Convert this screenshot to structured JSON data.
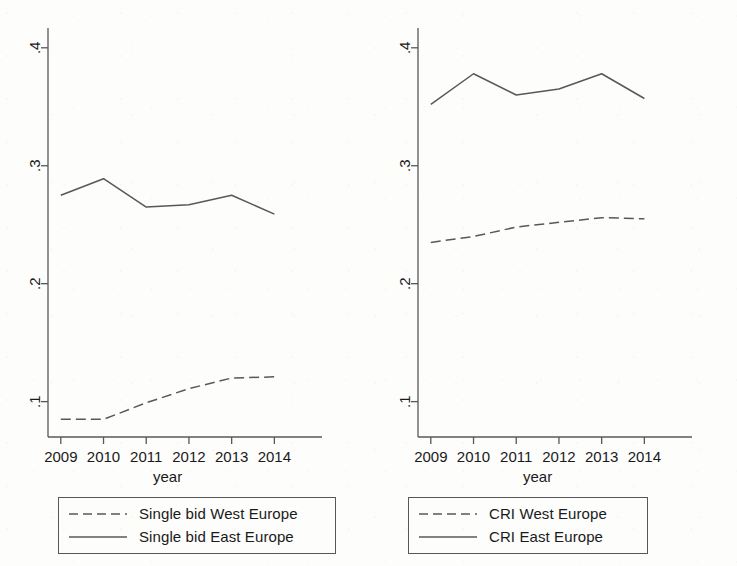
{
  "figure": {
    "background_color": "#fdfdfc",
    "line_color": "#58585a",
    "text_color": "#1a1a1a"
  },
  "panels": [
    {
      "id": "left",
      "axis": {
        "x_label": "year",
        "x_ticks": [
          "2009",
          "2010",
          "2011",
          "2012",
          "2013",
          "2014"
        ],
        "y_ticks": [
          ".1",
          ".2",
          ".3",
          ".4"
        ]
      },
      "legend": {
        "entries": [
          {
            "label": "Single bid West Europe",
            "style": "dashed"
          },
          {
            "label": "Single bid East Europe",
            "style": "solid"
          }
        ]
      }
    },
    {
      "id": "right",
      "axis": {
        "x_label": "year",
        "x_ticks": [
          "2009",
          "2010",
          "2011",
          "2012",
          "2013",
          "2014"
        ],
        "y_ticks": [
          ".1",
          ".2",
          ".3",
          ".4"
        ]
      },
      "legend": {
        "entries": [
          {
            "label": "CRI West Europe",
            "style": "dashed"
          },
          {
            "label": "CRI East Europe",
            "style": "solid"
          }
        ]
      }
    }
  ],
  "chart_data": [
    {
      "type": "line",
      "panel": "left",
      "title": "",
      "xlabel": "year",
      "ylabel": "",
      "x": [
        2009,
        2010,
        2011,
        2012,
        2013,
        2014
      ],
      "xtick_labels": [
        "2009",
        "2010",
        "2011",
        "2012",
        "2013",
        "2014"
      ],
      "ytick_labels": [
        ".1",
        ".2",
        ".3",
        ".4"
      ],
      "ytick_values": [
        0.1,
        0.2,
        0.3,
        0.4
      ],
      "ylim": [
        0.07,
        0.41
      ],
      "xlim": [
        2008.7,
        2014.6
      ],
      "grid": false,
      "legend_position": "below",
      "series": [
        {
          "name": "Single bid West Europe",
          "style": "dashed",
          "values": [
            0.085,
            0.085,
            0.099,
            0.111,
            0.12,
            0.121
          ]
        },
        {
          "name": "Single bid East Europe",
          "style": "solid",
          "values": [
            0.275,
            0.289,
            0.265,
            0.267,
            0.275,
            0.259
          ]
        }
      ]
    },
    {
      "type": "line",
      "panel": "right",
      "title": "",
      "xlabel": "year",
      "ylabel": "",
      "x": [
        2009,
        2010,
        2011,
        2012,
        2013,
        2014
      ],
      "xtick_labels": [
        "2009",
        "2010",
        "2011",
        "2012",
        "2013",
        "2014"
      ],
      "ytick_labels": [
        ".1",
        ".2",
        ".3",
        ".4"
      ],
      "ytick_values": [
        0.1,
        0.2,
        0.3,
        0.4
      ],
      "ylim": [
        0.07,
        0.41
      ],
      "xlim": [
        2008.7,
        2014.6
      ],
      "grid": false,
      "legend_position": "below",
      "series": [
        {
          "name": "CRI West Europe",
          "style": "dashed",
          "values": [
            0.235,
            0.24,
            0.248,
            0.252,
            0.256,
            0.255
          ]
        },
        {
          "name": "CRI East Europe",
          "style": "solid",
          "values": [
            0.352,
            0.378,
            0.36,
            0.365,
            0.378,
            0.357
          ]
        }
      ]
    }
  ]
}
